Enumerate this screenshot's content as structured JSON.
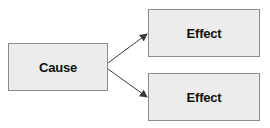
{
  "diagram": {
    "type": "cause-effect",
    "nodes": [
      {
        "id": "cause",
        "label": "Cause"
      },
      {
        "id": "effect1",
        "label": "Effect"
      },
      {
        "id": "effect2",
        "label": "Effect"
      }
    ],
    "edges": [
      {
        "from": "cause",
        "to": "effect1"
      },
      {
        "from": "cause",
        "to": "effect2"
      }
    ],
    "colors": {
      "box_fill": "#ececec",
      "box_border": "#8c8c8c",
      "arrow": "#3a3a3a",
      "text": "#111111"
    }
  }
}
